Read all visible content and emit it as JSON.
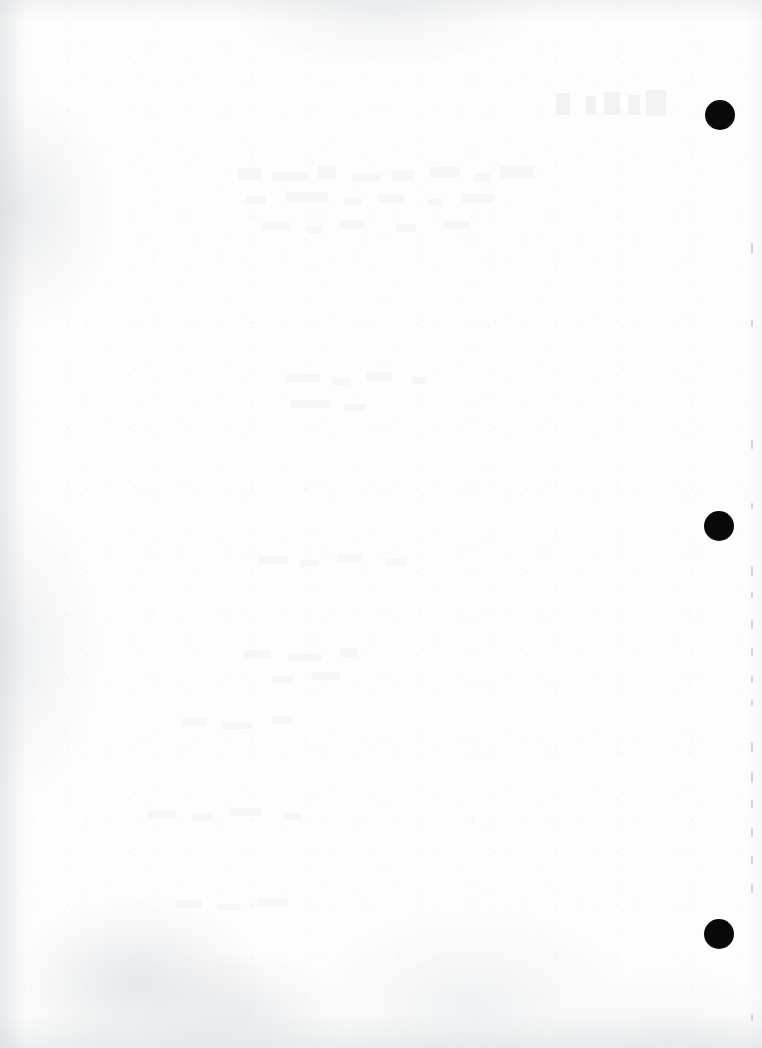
{
  "document": {
    "kind": "scanned-page",
    "title": "Scanned blank page",
    "page_width": 762,
    "page_height": 1048,
    "paper_color": "#fdfdfd",
    "mark_color": "#0a0a0a",
    "edge_tick_color": "#b0b4ba",
    "ghost_text_color": "#c4c8cd",
    "visible_text": "",
    "note": "Page contains no legible text; only scan artifacts and binding marks."
  },
  "punch_marks": [
    {
      "label": "top binding mark",
      "cx": 720,
      "cy": 115,
      "d": 30
    },
    {
      "label": "middle binding mark",
      "cx": 719,
      "cy": 526,
      "d": 30
    },
    {
      "label": "bottom binding mark",
      "cx": 719,
      "cy": 934,
      "d": 30
    }
  ],
  "edge_ticks": [
    {
      "y": 243,
      "h": 11
    },
    {
      "y": 320,
      "h": 7
    },
    {
      "y": 440,
      "h": 9
    },
    {
      "y": 503,
      "h": 6
    },
    {
      "y": 566,
      "h": 10
    },
    {
      "y": 592,
      "h": 6
    },
    {
      "y": 620,
      "h": 9
    },
    {
      "y": 648,
      "h": 8
    },
    {
      "y": 676,
      "h": 7
    },
    {
      "y": 700,
      "h": 6
    },
    {
      "y": 742,
      "h": 10
    },
    {
      "y": 772,
      "h": 11
    },
    {
      "y": 800,
      "h": 8
    },
    {
      "y": 828,
      "h": 9
    },
    {
      "y": 856,
      "h": 8
    },
    {
      "y": 884,
      "h": 9
    },
    {
      "y": 1014,
      "h": 7
    }
  ],
  "ghost_marks": [
    {
      "x": 556,
      "y": 93,
      "w": 14,
      "h": 22,
      "tone": "faint"
    },
    {
      "x": 586,
      "y": 96,
      "w": 10,
      "h": 19,
      "tone": "faint"
    },
    {
      "x": 604,
      "y": 92,
      "w": 16,
      "h": 23,
      "tone": "faint"
    },
    {
      "x": 628,
      "y": 95,
      "w": 12,
      "h": 20,
      "tone": "faint"
    },
    {
      "x": 646,
      "y": 90,
      "w": 20,
      "h": 26,
      "tone": "faint"
    },
    {
      "x": 238,
      "y": 168,
      "w": 24,
      "h": 12,
      "tone": "vfaint"
    },
    {
      "x": 272,
      "y": 172,
      "w": 36,
      "h": 9,
      "tone": "vfaint"
    },
    {
      "x": 318,
      "y": 166,
      "w": 18,
      "h": 13,
      "tone": "vfaint"
    },
    {
      "x": 352,
      "y": 174,
      "w": 28,
      "h": 8,
      "tone": "vfaint"
    },
    {
      "x": 392,
      "y": 170,
      "w": 22,
      "h": 11,
      "tone": "vfaint"
    },
    {
      "x": 430,
      "y": 167,
      "w": 30,
      "h": 10,
      "tone": "vfaint"
    },
    {
      "x": 474,
      "y": 173,
      "w": 16,
      "h": 9,
      "tone": "vfaint"
    },
    {
      "x": 500,
      "y": 166,
      "w": 34,
      "h": 12,
      "tone": "vfaint"
    },
    {
      "x": 246,
      "y": 196,
      "w": 20,
      "h": 8,
      "tone": "vfaint"
    },
    {
      "x": 286,
      "y": 192,
      "w": 42,
      "h": 10,
      "tone": "vfaint"
    },
    {
      "x": 344,
      "y": 198,
      "w": 18,
      "h": 7,
      "tone": "vfaint"
    },
    {
      "x": 378,
      "y": 194,
      "w": 26,
      "h": 9,
      "tone": "vfaint"
    },
    {
      "x": 428,
      "y": 199,
      "w": 14,
      "h": 7,
      "tone": "vfaint"
    },
    {
      "x": 462,
      "y": 193,
      "w": 32,
      "h": 10,
      "tone": "vfaint"
    },
    {
      "x": 262,
      "y": 222,
      "w": 28,
      "h": 8,
      "tone": "vfaint"
    },
    {
      "x": 306,
      "y": 226,
      "w": 16,
      "h": 7,
      "tone": "vfaint"
    },
    {
      "x": 340,
      "y": 220,
      "w": 24,
      "h": 9,
      "tone": "vfaint"
    },
    {
      "x": 396,
      "y": 224,
      "w": 20,
      "h": 8,
      "tone": "vfaint"
    },
    {
      "x": 444,
      "y": 221,
      "w": 26,
      "h": 8,
      "tone": "vfaint"
    },
    {
      "x": 286,
      "y": 374,
      "w": 34,
      "h": 9,
      "tone": "vfaint"
    },
    {
      "x": 332,
      "y": 378,
      "w": 18,
      "h": 7,
      "tone": "vfaint"
    },
    {
      "x": 366,
      "y": 372,
      "w": 26,
      "h": 9,
      "tone": "vfaint"
    },
    {
      "x": 412,
      "y": 377,
      "w": 14,
      "h": 7,
      "tone": "vfaint"
    },
    {
      "x": 290,
      "y": 400,
      "w": 40,
      "h": 8,
      "tone": "vfaint"
    },
    {
      "x": 344,
      "y": 404,
      "w": 22,
      "h": 7,
      "tone": "vfaint"
    },
    {
      "x": 258,
      "y": 556,
      "w": 30,
      "h": 8,
      "tone": "vfaint"
    },
    {
      "x": 300,
      "y": 560,
      "w": 18,
      "h": 7,
      "tone": "vfaint"
    },
    {
      "x": 338,
      "y": 554,
      "w": 24,
      "h": 8,
      "tone": "vfaint"
    },
    {
      "x": 386,
      "y": 559,
      "w": 20,
      "h": 7,
      "tone": "vfaint"
    },
    {
      "x": 244,
      "y": 650,
      "w": 26,
      "h": 8,
      "tone": "vfaint"
    },
    {
      "x": 288,
      "y": 654,
      "w": 34,
      "h": 7,
      "tone": "vfaint"
    },
    {
      "x": 340,
      "y": 648,
      "w": 18,
      "h": 9,
      "tone": "vfaint"
    },
    {
      "x": 272,
      "y": 676,
      "w": 22,
      "h": 7,
      "tone": "vfaint"
    },
    {
      "x": 312,
      "y": 672,
      "w": 28,
      "h": 8,
      "tone": "vfaint"
    },
    {
      "x": 182,
      "y": 718,
      "w": 24,
      "h": 8,
      "tone": "vfaint"
    },
    {
      "x": 222,
      "y": 722,
      "w": 30,
      "h": 7,
      "tone": "vfaint"
    },
    {
      "x": 272,
      "y": 716,
      "w": 20,
      "h": 8,
      "tone": "vfaint"
    },
    {
      "x": 148,
      "y": 810,
      "w": 28,
      "h": 8,
      "tone": "vfaint"
    },
    {
      "x": 192,
      "y": 814,
      "w": 20,
      "h": 7,
      "tone": "vfaint"
    },
    {
      "x": 230,
      "y": 808,
      "w": 32,
      "h": 8,
      "tone": "vfaint"
    },
    {
      "x": 284,
      "y": 813,
      "w": 18,
      "h": 7,
      "tone": "vfaint"
    },
    {
      "x": 176,
      "y": 900,
      "w": 26,
      "h": 8,
      "tone": "vfaint"
    },
    {
      "x": 218,
      "y": 904,
      "w": 22,
      "h": 7,
      "tone": "vfaint"
    },
    {
      "x": 258,
      "y": 898,
      "w": 30,
      "h": 8,
      "tone": "vfaint"
    }
  ]
}
